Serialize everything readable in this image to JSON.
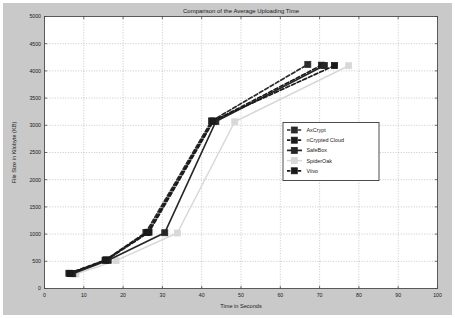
{
  "chart_data": {
    "type": "line",
    "title": "Comparison of the Average Uploading Time",
    "xlabel": "Time in Seconds",
    "ylabel": "File Size in Kilobyte (KB)",
    "xlim": [
      0,
      100
    ],
    "ylim": [
      0,
      5000
    ],
    "xticks": [
      0,
      10,
      20,
      30,
      40,
      50,
      60,
      70,
      80,
      90,
      100
    ],
    "yticks": [
      0,
      500,
      1000,
      1500,
      2000,
      2500,
      3000,
      3500,
      4000,
      4500,
      5000
    ],
    "grid": true,
    "legend_position": "center-right",
    "marker": "square",
    "series": [
      {
        "name": "AxCrypt",
        "color": "#2b2b2b",
        "linestyle": "dashed",
        "points": [
          [
            6.2,
            280
          ],
          [
            15.4,
            520
          ],
          [
            25.8,
            1030
          ],
          [
            42.5,
            3080
          ],
          [
            67.0,
            4120
          ]
        ]
      },
      {
        "name": "nCrypted Cloud",
        "color": "#1c1c1c",
        "linestyle": "dashed",
        "points": [
          [
            6.8,
            275
          ],
          [
            15.8,
            525
          ],
          [
            26.6,
            1035
          ],
          [
            43.0,
            3075
          ],
          [
            70.5,
            4105
          ]
        ]
      },
      {
        "name": "SafeBox",
        "color": "#262626",
        "linestyle": "solid",
        "points": [
          [
            7.2,
            272
          ],
          [
            16.2,
            518
          ],
          [
            30.6,
            1025
          ],
          [
            43.6,
            3070
          ],
          [
            71.2,
            4100
          ]
        ]
      },
      {
        "name": "SpiderOak",
        "color": "#d8d8d8",
        "linestyle": "solid",
        "points": [
          [
            8.0,
            268
          ],
          [
            18.2,
            512
          ],
          [
            33.8,
            1020
          ],
          [
            48.4,
            3065
          ],
          [
            77.4,
            4095
          ]
        ]
      },
      {
        "name": "Viivo",
        "color": "#1a1a1a",
        "linestyle": "dashed",
        "points": [
          [
            6.5,
            278
          ],
          [
            15.6,
            522
          ],
          [
            26.2,
            1032
          ],
          [
            42.8,
            3078
          ],
          [
            73.8,
            4098
          ]
        ]
      }
    ]
  },
  "legend": {
    "items": [
      {
        "label": "AxCrypt"
      },
      {
        "label": "nCrypted Cloud"
      },
      {
        "label": "SafeBox"
      },
      {
        "label": "SpiderOak"
      },
      {
        "label": "Viivo"
      }
    ]
  },
  "colors": {
    "figure_background": "#c9c9c9",
    "axes_background": "#ffffff",
    "grid": "#9a9a9a",
    "axis_line": "#4a4a4a",
    "text": "#1a1a1a"
  }
}
